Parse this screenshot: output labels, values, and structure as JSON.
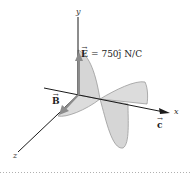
{
  "figure": {
    "axes": {
      "x_label": "x",
      "y_label": "y",
      "z_label": "z"
    },
    "electric_field": {
      "symbol": "E",
      "equation": "= 750ĵ N/C",
      "value": "750",
      "unit_vector": "ĵ",
      "unit": "N/C"
    },
    "magnetic_field": {
      "symbol": "B"
    },
    "wave_velocity": {
      "symbol": "c"
    },
    "colors": {
      "wave_fill": "#d9d9d9",
      "wave_edge": "#9a9a9a",
      "vector_arrow": "#8c8c8c",
      "axis": "#1a1a1a",
      "divider": "#b0b0b0"
    }
  }
}
